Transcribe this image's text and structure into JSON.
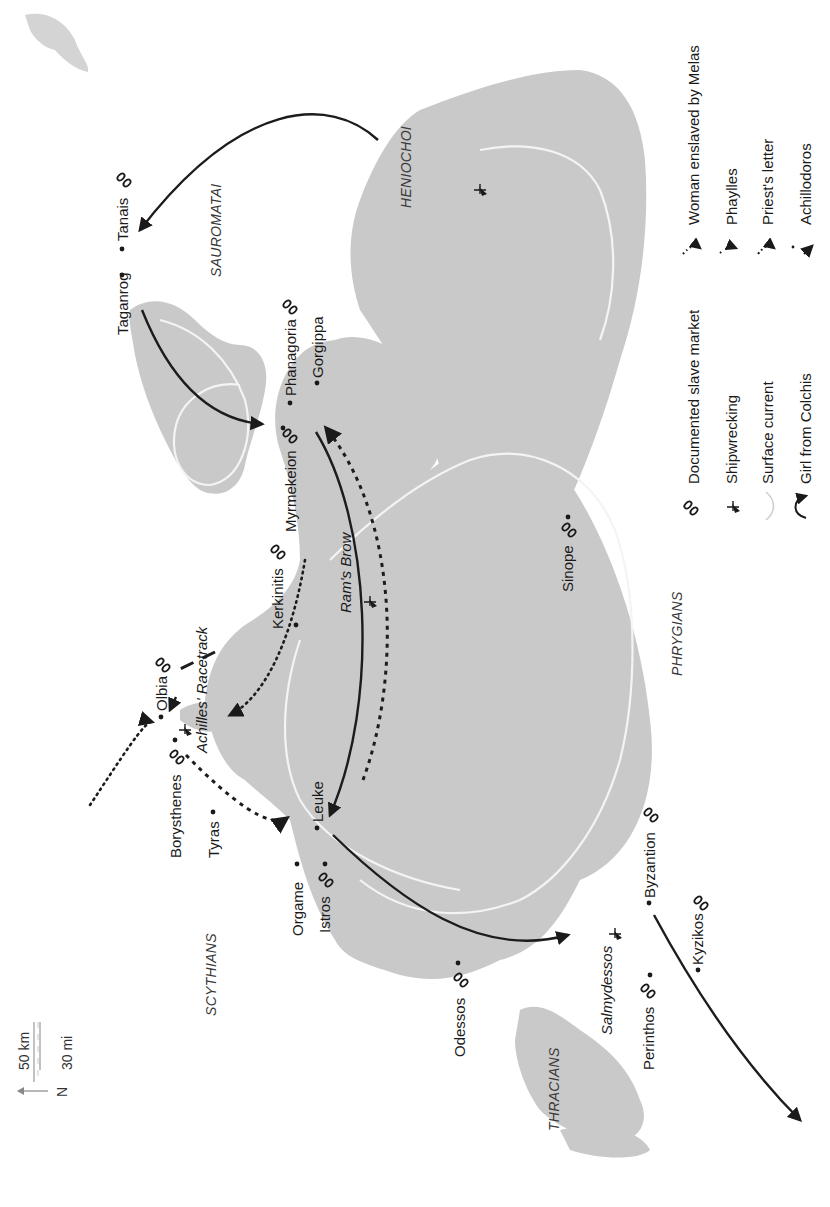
{
  "map": {
    "orientation": "rotated 90deg counter-clockwise; north points left",
    "scale_bar": {
      "km_label": "50 km",
      "mi_label": "30 mi",
      "north_label": "N"
    },
    "peoples": [
      {
        "id": "sauromatai",
        "label": "SAUROMATAI"
      },
      {
        "id": "heniochoi",
        "label": "HENIOCHOI"
      },
      {
        "id": "scythians",
        "label": "SCYTHIANS"
      },
      {
        "id": "thracians",
        "label": "THRACIANS"
      },
      {
        "id": "phrygians",
        "label": "PHRYGIANS"
      }
    ],
    "places": [
      {
        "id": "tanais",
        "label": "Tanais",
        "slave_market": true
      },
      {
        "id": "taganrog",
        "label": "Taganrog",
        "slave_market": false
      },
      {
        "id": "phanagoria",
        "label": "Phanagoria",
        "slave_market": true
      },
      {
        "id": "gorgippa",
        "label": "Gorgippa",
        "slave_market": false
      },
      {
        "id": "myrmekeion",
        "label": "Myrmekeion",
        "slave_market": true
      },
      {
        "id": "kerkinitis",
        "label": "Kerkinitis",
        "slave_market": true
      },
      {
        "id": "rams_brow",
        "label": "Ram's Brow",
        "slave_market": false,
        "italic": true
      },
      {
        "id": "olbia",
        "label": "Olbia",
        "slave_market": true
      },
      {
        "id": "achilles_racetrack",
        "label": "Achilles' Racetrack",
        "slave_market": false,
        "italic": true
      },
      {
        "id": "borysthenes",
        "label": "Borysthenes",
        "slave_market": true
      },
      {
        "id": "tyras",
        "label": "Tyras",
        "slave_market": false
      },
      {
        "id": "leuke",
        "label": "Leuke",
        "slave_market": false
      },
      {
        "id": "orgame",
        "label": "Orgame",
        "slave_market": false
      },
      {
        "id": "istros",
        "label": "Istros",
        "slave_market": true
      },
      {
        "id": "odessos",
        "label": "Odessos",
        "slave_market": true
      },
      {
        "id": "salmydessos",
        "label": "Salmydessos",
        "slave_market": false,
        "italic": true
      },
      {
        "id": "byzantion",
        "label": "Byzantion",
        "slave_market": true
      },
      {
        "id": "perinthos",
        "label": "Perinthos",
        "slave_market": true
      },
      {
        "id": "kyzikos",
        "label": "Kyzikos",
        "slave_market": true
      },
      {
        "id": "sinope",
        "label": "Sinope",
        "slave_market": true
      }
    ],
    "legend": {
      "left_column": [
        {
          "symbol": "chain-icon",
          "label": "Documented slave market"
        },
        {
          "symbol": "shipwreck-icon",
          "label": "Shipwrecking"
        },
        {
          "symbol": "surface-current-icon",
          "label": "Surface current"
        },
        {
          "symbol": "curved-arrow-icon",
          "label": "Girl from Colchis"
        }
      ],
      "right_column": [
        {
          "symbol": "dotted-arrow-icon",
          "label": "Woman enslaved by Melas"
        },
        {
          "symbol": "sparse-dotted-arrow-icon",
          "label": "Phaylles"
        },
        {
          "symbol": "dotted-arrow-icon",
          "label": "Priest's letter"
        },
        {
          "symbol": "solid-arrow-icon",
          "label": "Achillodoros"
        }
      ]
    },
    "colors": {
      "sea": "#c9c9c9",
      "land": "#ffffff",
      "ink": "#1a1a1a",
      "current": "#f4f4f4"
    }
  }
}
